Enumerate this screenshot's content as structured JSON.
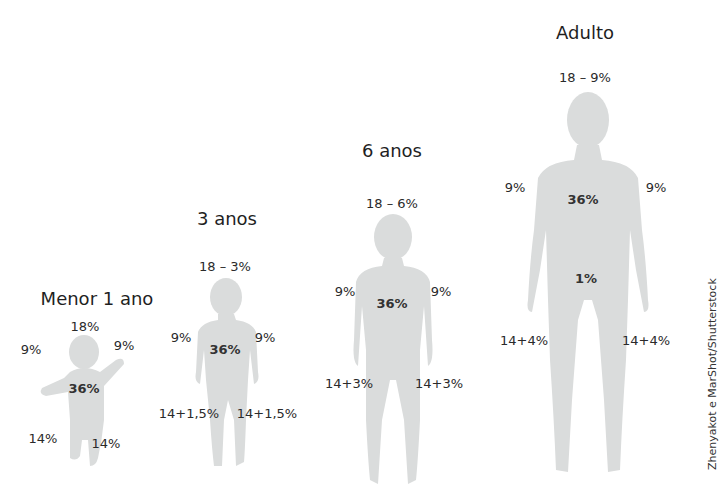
{
  "figures": [
    {
      "id": "infant",
      "title": "Menor 1 ano",
      "labels": {
        "head": "18%",
        "left_arm": "9%",
        "right_arm": "9%",
        "trunk": "36%",
        "left_leg": "14%",
        "right_leg": "14%"
      }
    },
    {
      "id": "age3",
      "title": "3 anos",
      "labels": {
        "head": "18 – 3%",
        "left_arm": "9%",
        "right_arm": "9%",
        "trunk": "36%",
        "left_leg": "14+1,5%",
        "right_leg": "14+1,5%"
      }
    },
    {
      "id": "age6",
      "title": "6 anos",
      "labels": {
        "head": "18 – 6%",
        "left_arm": "9%",
        "right_arm": "9%",
        "trunk": "36%",
        "left_leg": "14+3%",
        "right_leg": "14+3%"
      }
    },
    {
      "id": "adult",
      "title": "Adulto",
      "labels": {
        "head": "18 – 9%",
        "left_arm": "9%",
        "right_arm": "9%",
        "trunk": "36%",
        "genitals": "1%",
        "left_leg": "14+4%",
        "right_leg": "14+4%"
      }
    }
  ],
  "credit": "Zhenyakot e MarShot/Shutterstock",
  "colors": {
    "silhouette": "#dadcdc",
    "text": "#2a2a2a",
    "background": "#ffffff"
  }
}
